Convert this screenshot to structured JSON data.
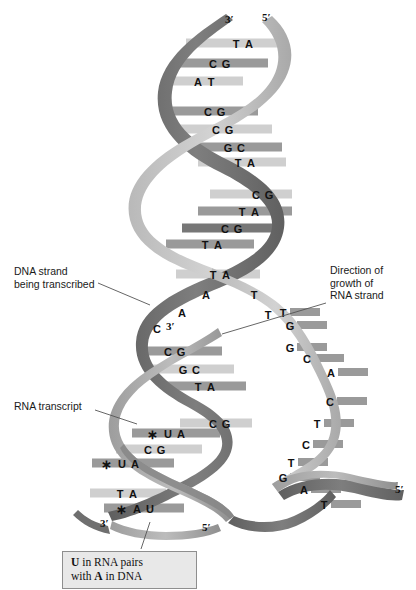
{
  "figure": {
    "background": "#ffffff"
  },
  "colors": {
    "backbone_dark": "#6e6e6e",
    "backbone_mid": "#8d8d8d",
    "backbone_light": "#b5b5b5",
    "rung_light": "#cfcfcf",
    "rung_mid": "#9a9a9a",
    "rung_dark": "#777777",
    "rna_strand": "#a8a8a8",
    "text": "#111111",
    "caption_fill": "#e8e8e8",
    "caption_border": "#8e8e8e",
    "leader_line": "#555555"
  },
  "annotations": {
    "dna_strand": "DNA strand\nbeing transcribed",
    "direction": "Direction of\ngrowth of\nRNA strand",
    "rna_transcript": "RNA transcript"
  },
  "caption": {
    "line1_pre": "U",
    "line1_post": " in RNA pairs",
    "line2_pre": "with ",
    "line2_bold": "A",
    "line2_post": " in DNA",
    "full_text": "U in RNA pairs with A in DNA"
  },
  "prime_labels": [
    {
      "name": "top-left-3prime",
      "text": "3′",
      "x": 225,
      "y": 13
    },
    {
      "name": "top-right-5prime",
      "text": "5′",
      "x": 262,
      "y": 11
    },
    {
      "name": "rna-3prime-middle",
      "text": "3′",
      "x": 166,
      "y": 320
    },
    {
      "name": "bottom-left-3prime",
      "text": "3′",
      "x": 100,
      "y": 517
    },
    {
      "name": "bottom-mid-5prime",
      "text": "5′",
      "x": 202,
      "y": 521
    },
    {
      "name": "bottom-right-5prime",
      "text": "5′",
      "x": 395,
      "y": 483
    }
  ],
  "base_pairs_duplex": [
    {
      "left": "T",
      "right": "A",
      "x": 236,
      "y": 44,
      "rung_x": 186,
      "rung_w": 92,
      "tone": "rung_light"
    },
    {
      "left": "C",
      "right": "G",
      "x": 213,
      "y": 64,
      "rung_x": 176,
      "rung_w": 92,
      "tone": "rung_mid"
    },
    {
      "left": "A",
      "right": "T",
      "x": 198,
      "y": 82,
      "rung_x": 165,
      "rung_w": 78,
      "tone": "rung_light"
    },
    {
      "left": "C",
      "right": "G",
      "x": 208,
      "y": 112,
      "rung_x": 172,
      "rung_w": 86,
      "tone": "rung_mid"
    },
    {
      "left": "C",
      "right": "G",
      "x": 216,
      "y": 130,
      "rung_x": 180,
      "rung_w": 92,
      "tone": "rung_light"
    },
    {
      "left": "G",
      "right": "C",
      "x": 228,
      "y": 148,
      "rung_x": 190,
      "rung_w": 92,
      "tone": "rung_mid"
    },
    {
      "left": "T",
      "right": "A",
      "x": 238,
      "y": 163,
      "rung_x": 198,
      "rung_w": 88,
      "tone": "rung_light"
    },
    {
      "left": "C",
      "right": "G",
      "x": 256,
      "y": 195,
      "rung_x": 210,
      "rung_w": 82,
      "tone": "rung_light"
    },
    {
      "left": "T",
      "right": "A",
      "x": 242,
      "y": 212,
      "rung_x": 198,
      "rung_w": 94,
      "tone": "rung_mid"
    },
    {
      "left": "C",
      "right": "G",
      "x": 225,
      "y": 229,
      "rung_x": 182,
      "rung_w": 100,
      "tone": "rung_dark"
    },
    {
      "left": "T",
      "right": "A",
      "x": 205,
      "y": 245,
      "rung_x": 166,
      "rung_w": 88,
      "tone": "rung_mid"
    },
    {
      "left": "T",
      "right": "A",
      "x": 213,
      "y": 275,
      "rung_x": 176,
      "rung_w": 84,
      "tone": "rung_light"
    }
  ],
  "split_bases_left": [
    {
      "base": "A",
      "x": 206,
      "y": 295
    },
    {
      "base": "A",
      "x": 182,
      "y": 313
    },
    {
      "base": "C",
      "x": 157,
      "y": 329
    }
  ],
  "split_bases_right": [
    {
      "base": "T",
      "x": 254,
      "y": 295
    },
    {
      "base": "T",
      "x": 268,
      "y": 315
    }
  ],
  "hybrid_pairs": [
    {
      "left": "C",
      "right": "G",
      "x": 168,
      "y": 352,
      "rung_x": 140,
      "rung_w": 82,
      "tone": "rung_mid",
      "star": false
    },
    {
      "left": "G",
      "right": "C",
      "x": 183,
      "y": 370,
      "rung_x": 152,
      "rung_w": 82,
      "tone": "rung_light",
      "star": false
    },
    {
      "left": "T",
      "right": "A",
      "x": 198,
      "y": 387,
      "rung_x": 166,
      "rung_w": 80,
      "tone": "rung_mid",
      "star": false
    },
    {
      "left": "C",
      "right": "G",
      "x": 213,
      "y": 424,
      "rung_x": 180,
      "rung_w": 72,
      "tone": "rung_light",
      "star": false
    },
    {
      "left": "U",
      "right": "A",
      "x": 168,
      "y": 434,
      "rung_x": 132,
      "rung_w": 88,
      "tone": "rung_mid",
      "star": true
    },
    {
      "left": "C",
      "right": "G",
      "x": 148,
      "y": 450,
      "rung_x": 116,
      "rung_w": 86,
      "tone": "rung_light",
      "star": false
    },
    {
      "left": "U",
      "right": "A",
      "x": 122,
      "y": 464,
      "rung_x": 92,
      "rung_w": 82,
      "tone": "rung_mid",
      "star": true
    },
    {
      "left": "T",
      "right": "A",
      "x": 120,
      "y": 494,
      "rung_x": 90,
      "rung_w": 76,
      "tone": "rung_light",
      "star": false
    },
    {
      "left": "A",
      "right": "U",
      "x": 137,
      "y": 509,
      "rung_x": 104,
      "rung_w": 80,
      "tone": "rung_mid",
      "star": true
    }
  ],
  "template_strand_bases": [
    {
      "base": "T",
      "x": 283,
      "y": 313
    },
    {
      "base": "G",
      "x": 290,
      "y": 326
    },
    {
      "base": "G",
      "x": 290,
      "y": 348
    },
    {
      "base": "C",
      "x": 307,
      "y": 359
    },
    {
      "base": "A",
      "x": 331,
      "y": 373
    },
    {
      "base": "C",
      "x": 330,
      "y": 402
    },
    {
      "base": "T",
      "x": 317,
      "y": 424
    },
    {
      "base": "C",
      "x": 306,
      "y": 445
    },
    {
      "base": "T",
      "x": 291,
      "y": 463
    },
    {
      "base": "G",
      "x": 283,
      "y": 478
    },
    {
      "base": "A",
      "x": 304,
      "y": 490
    },
    {
      "base": "T",
      "x": 324,
      "y": 505
    }
  ],
  "leader_lines": [
    {
      "name": "dna-strand-leader",
      "x1": 98,
      "y1": 283,
      "x2": 150,
      "y2": 305
    },
    {
      "name": "direction-leader",
      "x1": 326,
      "y1": 303,
      "x2": 222,
      "y2": 334
    },
    {
      "name": "rna-transcript-leader",
      "x1": 95,
      "y1": 410,
      "x2": 137,
      "y2": 424
    },
    {
      "name": "caption-leader",
      "x1": 141,
      "y1": 549,
      "x2": 150,
      "y2": 522
    }
  ]
}
